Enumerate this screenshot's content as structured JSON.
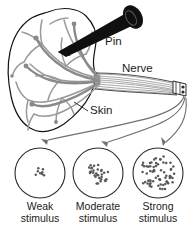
{
  "figure": {
    "background_color": "#ffffff",
    "ink_color": "#1b1b1b",
    "nerve_color": "#8a8a8a",
    "pin_color": "#101010",
    "arrow_color": "#6f6f6f"
  },
  "callouts": {
    "pin": "Pin",
    "nerve": "Nerve",
    "skin": "Skin"
  },
  "panels": [
    {
      "id": "weak",
      "label_line1": "Weak",
      "label_line2": "stimulus",
      "dot_count": 8,
      "cluster_radius": 5,
      "circle_radius": 25,
      "cx": 40,
      "cy": 173
    },
    {
      "id": "moderate",
      "label_line1": "Moderate",
      "label_line2": "stimulus",
      "dot_count": 31,
      "cluster_radius": 11,
      "circle_radius": 25,
      "cx": 98,
      "cy": 173
    },
    {
      "id": "strong",
      "label_line1": "Strong",
      "label_line2": "stimulus",
      "dot_count": 68,
      "cluster_radius": 18,
      "circle_radius": 25,
      "cx": 158,
      "cy": 173
    }
  ],
  "chart_data": {
    "type": "scatter",
    "categories": [
      "Weak stimulus",
      "Moderate stimulus",
      "Strong stimulus"
    ],
    "values": [
      8,
      31,
      68
    ],
    "xlabel": "Stimulus strength",
    "ylabel": "Number of impulses (dots)",
    "legend": [],
    "grid": false
  }
}
